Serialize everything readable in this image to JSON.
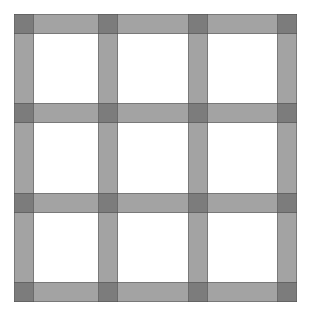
{
  "figure": {
    "title": "",
    "width": 311,
    "height": 311,
    "background_color": "#ffffff"
  },
  "colors": {
    "background": "#ffffff",
    "band_fill": "#a8a8a8",
    "band_fill_rgba": "rgba(96,96,96,0.58)",
    "intersection_fill": "#6e6e6e",
    "band_edge": "rgba(70,70,70,0.45)"
  },
  "chart_data": {
    "type": "heatmap",
    "title": "",
    "subtitle": "",
    "xlabel": "",
    "ylabel": "",
    "grid": true,
    "legend_position": "none",
    "xlim": [
      0,
      311
    ],
    "ylim": [
      0,
      311
    ],
    "band_thickness": 20,
    "vertical_bands": [
      {
        "name": "v1",
        "x": 14,
        "width": 20
      },
      {
        "name": "v2",
        "x": 98,
        "width": 20
      },
      {
        "name": "v3",
        "x": 188,
        "width": 20
      },
      {
        "name": "v4",
        "x": 277,
        "width": 20
      }
    ],
    "horizontal_bands": [
      {
        "name": "h1",
        "y": 14,
        "height": 20
      },
      {
        "name": "h2",
        "y": 103,
        "height": 20
      },
      {
        "name": "h3",
        "y": 193,
        "height": 20
      },
      {
        "name": "h4",
        "y": 282,
        "height": 20
      }
    ],
    "intersections_count": 16,
    "cells_count": 9,
    "annotations": []
  }
}
